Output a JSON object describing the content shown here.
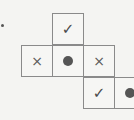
{
  "puzzle": {
    "stray_mark": "dot",
    "cells": [
      {
        "row": 0,
        "col": 1,
        "mark": "check",
        "symbol": "✓"
      },
      {
        "row": 1,
        "col": 0,
        "mark": "cross",
        "symbol": "×"
      },
      {
        "row": 1,
        "col": 1,
        "mark": "dot",
        "symbol": ""
      },
      {
        "row": 1,
        "col": 2,
        "mark": "cross",
        "symbol": "×"
      },
      {
        "row": 2,
        "col": 2,
        "mark": "check",
        "symbol": "✓"
      },
      {
        "row": 2,
        "col": 3,
        "mark": "dot",
        "symbol": ""
      }
    ]
  }
}
